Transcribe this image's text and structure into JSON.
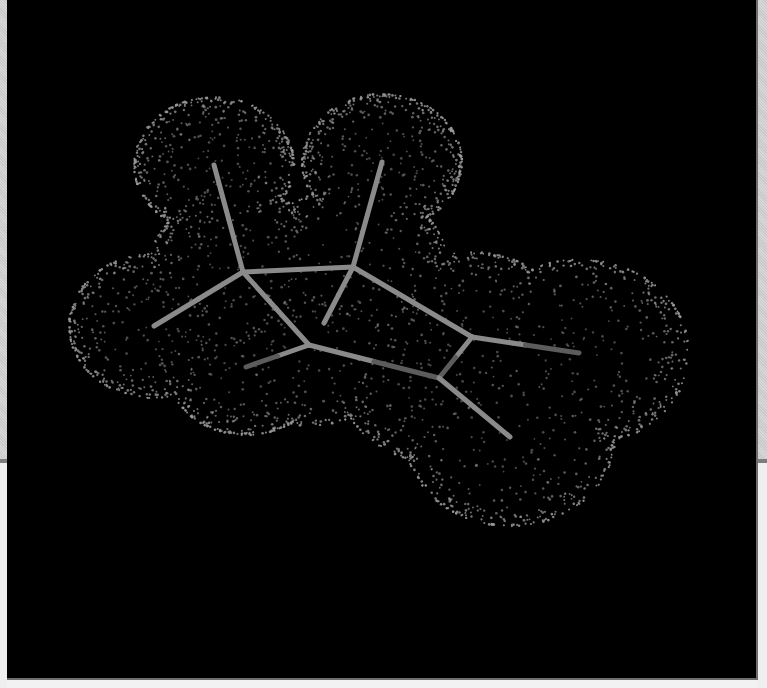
{
  "viewer": {
    "background": "#000000",
    "bond_color": "#8a8a8a",
    "bond_dark_color": "#5c5c5c",
    "dot_color": "#9a9a9a",
    "bond_width": 5
  },
  "molecule": {
    "atoms": [
      {
        "id": "C1",
        "x": 243,
        "y": 272,
        "z": 0.2,
        "r": 95
      },
      {
        "id": "C2",
        "x": 353,
        "y": 267,
        "z": 0.0,
        "r": 95
      },
      {
        "id": "C3",
        "x": 309,
        "y": 345,
        "z": 0.4,
        "r": 95
      },
      {
        "id": "C4",
        "x": 472,
        "y": 337,
        "z": 0.1,
        "r": 100
      },
      {
        "id": "C5",
        "x": 439,
        "y": 378,
        "z": 0.3,
        "r": 100
      },
      {
        "id": "H1",
        "x": 214,
        "y": 165,
        "z": 0.0,
        "r": 80
      },
      {
        "id": "H2",
        "x": 154,
        "y": 326,
        "z": 0.0,
        "r": 85
      },
      {
        "id": "H3",
        "x": 382,
        "y": 162,
        "z": 0.0,
        "r": 80
      },
      {
        "id": "H4",
        "x": 324,
        "y": 323,
        "z": -0.3,
        "r": 70
      },
      {
        "id": "H5",
        "x": 246,
        "y": 367,
        "z": 0.2,
        "r": 80
      },
      {
        "id": "X1",
        "x": 579,
        "y": 353,
        "z": 0.0,
        "r": 110
      },
      {
        "id": "X2",
        "x": 510,
        "y": 437,
        "z": 0.3,
        "r": 105
      }
    ],
    "bonds": [
      {
        "a": 0,
        "b": 1,
        "dark_half": false
      },
      {
        "a": 0,
        "b": 2,
        "dark_half": false
      },
      {
        "a": 1,
        "b": 3,
        "dark_half": false
      },
      {
        "a": 2,
        "b": 4,
        "dark_half": true
      },
      {
        "a": 3,
        "b": 4,
        "dark_half": true
      },
      {
        "a": 0,
        "b": 5,
        "dark_half": false
      },
      {
        "a": 0,
        "b": 6,
        "dark_half": false
      },
      {
        "a": 1,
        "b": 7,
        "dark_half": false
      },
      {
        "a": 1,
        "b": 8,
        "dark_half": false
      },
      {
        "a": 2,
        "b": 9,
        "dark_half": true
      },
      {
        "a": 3,
        "b": 10,
        "dark_half": true
      },
      {
        "a": 4,
        "b": 11,
        "dark_half": false
      }
    ]
  },
  "surface": {
    "type": "dotted-molecular-surface",
    "dot_count": 2600,
    "seed": 7
  }
}
